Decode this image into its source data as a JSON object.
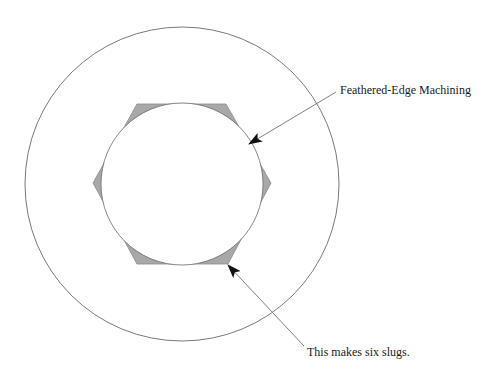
{
  "diagram": {
    "title": "",
    "colors": {
      "background": "#ffffff",
      "outline": "#7a7a7a",
      "slug_fill": "#a8a8a8",
      "arrow": "#111111",
      "leader": "#808080",
      "text": "#1a1a1a"
    },
    "outer_circle": {
      "cx": 182,
      "cy": 184,
      "r": 157
    },
    "hexagon": {
      "points": [
        [
          137,
          104
        ],
        [
          226,
          104
        ],
        [
          271,
          183
        ],
        [
          228,
          264
        ],
        [
          137,
          264
        ],
        [
          93,
          183
        ]
      ]
    },
    "inner_circle": {
      "cx": 182,
      "cy": 184,
      "r": 81
    },
    "annotations": [
      {
        "id": "feathered-edge",
        "text": "Feathered-Edge Machining",
        "text_x": 340,
        "text_y": 94,
        "line_from": [
          336,
          92
        ],
        "arrow_tip": [
          249,
          144
        ]
      },
      {
        "id": "six-slugs",
        "text": "This makes six slugs.",
        "text_x": 307,
        "text_y": 356,
        "line_from": [
          304,
          346
        ],
        "arrow_tip": [
          228,
          265
        ]
      }
    ]
  }
}
